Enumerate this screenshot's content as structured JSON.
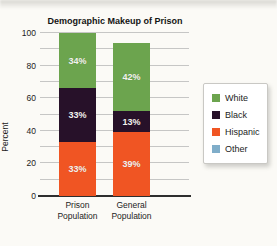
{
  "chart_data": {
    "type": "bar",
    "subtype": "stacked-vertical",
    "title": "Demographic Makeup of Prison",
    "xlabel": "",
    "ylabel": "Percent",
    "ylim": [
      0,
      100
    ],
    "ytick_labels": [
      0,
      20,
      40,
      60,
      80,
      100
    ],
    "grid_step": 10,
    "grid": "on",
    "categories": [
      "Prison Population",
      "General Population"
    ],
    "series": [
      {
        "name": "White",
        "color": "#6ca44e",
        "values": [
          34,
          42
        ],
        "labels": [
          "34%",
          "42%"
        ]
      },
      {
        "name": "Black",
        "color": "#271129",
        "values": [
          33,
          13
        ],
        "labels": [
          "33%",
          "13%"
        ]
      },
      {
        "name": "Hispanic",
        "color": "#f05523",
        "values": [
          33,
          39
        ],
        "labels": [
          "33%",
          "39%"
        ]
      }
    ],
    "legend": {
      "position": "right",
      "entries": [
        {
          "label": "White",
          "color": "#6ca44e"
        },
        {
          "label": "Black",
          "color": "#271129"
        },
        {
          "label": "Hispanic",
          "color": "#f05523"
        },
        {
          "label": "Other",
          "color": "#7fadc9"
        }
      ]
    }
  }
}
